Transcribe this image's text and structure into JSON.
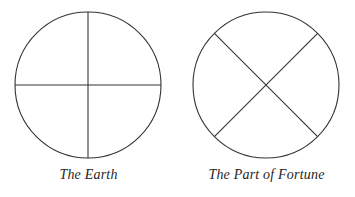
{
  "page": {
    "background_color": "#ffffff",
    "stroke_color": "#333333",
    "text_color": "#262626"
  },
  "figures": [
    {
      "id": "earth",
      "caption": "The Earth",
      "icon_name": "earth-cross-circle-icon",
      "shape": "circle with vertical and horizontal diameters",
      "circle": {
        "cx": 88,
        "cy": 77,
        "r": 73
      },
      "lines": [
        {
          "x1": 88,
          "y1": 4,
          "x2": 88,
          "y2": 150
        },
        {
          "x1": 15,
          "y1": 77,
          "x2": 161,
          "y2": 77
        }
      ]
    },
    {
      "id": "part-of-fortune",
      "caption": "The Part of Fortune",
      "icon_name": "part-of-fortune-x-circle-icon",
      "shape": "circle with two diagonal diameters forming an X",
      "circle": {
        "cx": 88,
        "cy": 77,
        "r": 73
      },
      "lines": [
        {
          "x1": 36.4,
          "y1": 25.4,
          "x2": 139.6,
          "y2": 128.6
        },
        {
          "x1": 139.6,
          "y1": 25.4,
          "x2": 36.4,
          "y2": 128.6
        }
      ]
    }
  ]
}
